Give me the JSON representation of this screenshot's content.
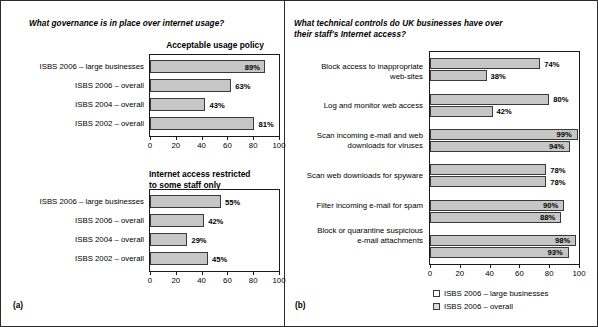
{
  "figure": {
    "panel_a_letter": "(a)",
    "panel_b_letter": "(b)"
  },
  "left": {
    "question": "What governance is in place over internet usage?",
    "charts": [
      {
        "title": "Acceptable usage policy",
        "categories": [
          "ISBS 2006 – large businesses",
          "ISBS 2006 – overall",
          "ISBS 2004 – overall",
          "ISBS 2002 – overall"
        ],
        "values": [
          89,
          63,
          43,
          81
        ],
        "labels": [
          "89%",
          "63%",
          "43%",
          "81%"
        ],
        "ticks": [
          "0",
          "20",
          "40",
          "60",
          "80",
          "100"
        ]
      },
      {
        "title": "Internet access restricted\nto some staff only",
        "categories": [
          "ISBS 2006 – large businesses",
          "ISBS 2006 – overall",
          "ISBS 2004 – overall",
          "ISBS 2002 – overall"
        ],
        "values": [
          55,
          42,
          29,
          45
        ],
        "labels": [
          "55%",
          "42%",
          "29%",
          "45%"
        ],
        "ticks": [
          "0",
          "20",
          "40",
          "60",
          "80",
          "100"
        ]
      }
    ]
  },
  "right": {
    "question": "What technical controls do UK businesses have over\ntheir staff's Internet access?",
    "chart": {
      "categories": [
        "Block access to inappropriate\nweb-sites",
        "Log and monitor web access",
        "Scan incoming e-mail and web\ndownloads for viruses",
        "Scan web downloads for spyware",
        "Filter incoming e-mail for spam",
        "Block or quarantine suspicious\ne-mail attachments"
      ],
      "series": [
        {
          "name": "ISBS 2006 – large businesses",
          "values": [
            74,
            80,
            99,
            78,
            90,
            98
          ],
          "labels": [
            "74%",
            "80%",
            "99%",
            "78%",
            "90%",
            "98%"
          ]
        },
        {
          "name": "ISBS 2006 – overall",
          "values": [
            38,
            42,
            94,
            78,
            88,
            93
          ],
          "labels": [
            "38%",
            "42%",
            "94%",
            "78%",
            "88%",
            "93%"
          ]
        }
      ],
      "ticks": [
        "0",
        "20",
        "40",
        "60",
        "80",
        "100"
      ],
      "legend": [
        "ISBS 2006 – large businesses",
        "ISBS 2006 – overall"
      ]
    }
  },
  "chart_data": [
    {
      "type": "bar",
      "orientation": "horizontal",
      "title": "Acceptable usage policy",
      "panel": "(a)",
      "question": "What governance is in place over internet usage?",
      "categories": [
        "ISBS 2006 – large businesses",
        "ISBS 2006 – overall",
        "ISBS 2004 – overall",
        "ISBS 2002 – overall"
      ],
      "values": [
        89,
        63,
        43,
        81
      ],
      "xlabel": "",
      "ylabel": "",
      "xlim": [
        0,
        100
      ],
      "xticks": [
        0,
        20,
        40,
        60,
        80,
        100
      ],
      "grid": false,
      "legend": "none",
      "unit": "%"
    },
    {
      "type": "bar",
      "orientation": "horizontal",
      "title": "Internet access restricted to some staff only",
      "panel": "(a)",
      "question": "What governance is in place over internet usage?",
      "categories": [
        "ISBS 2006 – large businesses",
        "ISBS 2006 – overall",
        "ISBS 2004 – overall",
        "ISBS 2002 – overall"
      ],
      "values": [
        55,
        42,
        29,
        45
      ],
      "xlabel": "",
      "ylabel": "",
      "xlim": [
        0,
        100
      ],
      "xticks": [
        0,
        20,
        40,
        60,
        80,
        100
      ],
      "grid": false,
      "legend": "none",
      "unit": "%"
    },
    {
      "type": "bar",
      "orientation": "horizontal",
      "title": "",
      "panel": "(b)",
      "question": "What technical controls do UK businesses have over their staff's Internet access?",
      "categories": [
        "Block access to inappropriate web-sites",
        "Log and monitor web access",
        "Scan incoming e-mail and web downloads for viruses",
        "Scan web downloads for spyware",
        "Filter incoming e-mail for spam",
        "Block or quarantine suspicious e-mail attachments"
      ],
      "series": [
        {
          "name": "ISBS 2006 – large businesses",
          "values": [
            74,
            80,
            99,
            78,
            90,
            98
          ]
        },
        {
          "name": "ISBS 2006 – overall",
          "values": [
            38,
            42,
            94,
            78,
            88,
            93
          ]
        }
      ],
      "xlabel": "",
      "ylabel": "",
      "xlim": [
        0,
        100
      ],
      "xticks": [
        0,
        20,
        40,
        60,
        80,
        100
      ],
      "grid": false,
      "legend": "bottom-right",
      "unit": "%"
    }
  ]
}
